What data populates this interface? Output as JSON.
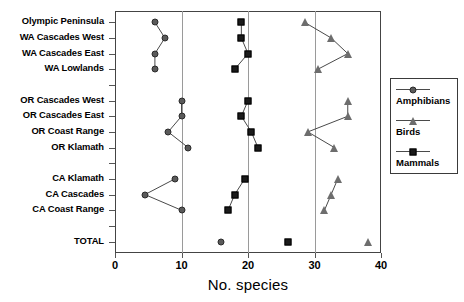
{
  "chart_data": {
    "type": "scatter",
    "title": "",
    "xlabel": "No. species",
    "ylabel": "",
    "xlim": [
      0,
      40
    ],
    "xticks": [
      0,
      10,
      20,
      30,
      40
    ],
    "xticklabels": [
      "0",
      "10",
      "20",
      "30",
      "40"
    ],
    "grid": "vertical gridlines at 10, 20, 30",
    "legend_position": "right-outside",
    "categories": [
      "Olympic Peninsula",
      "WA Cascades West",
      "WA Cascades East",
      "WA Lowlands",
      "",
      "OR Cascades West",
      "OR Cascades East",
      "OR Coast Range",
      "OR Klamath",
      "",
      "CA Klamath",
      "CA Cascades",
      "CA Coast Range",
      "",
      "TOTAL"
    ],
    "series": [
      {
        "name": "Amphibians",
        "marker": "circle",
        "color": "#5a5a5a",
        "values": [
          6,
          7.5,
          6,
          6,
          null,
          10,
          10,
          8,
          11,
          null,
          9,
          4.5,
          10,
          null,
          16
        ]
      },
      {
        "name": "Birds",
        "marker": "triangle",
        "color": "#6d6d6d",
        "values": [
          28.5,
          32.5,
          35,
          30.5,
          null,
          35,
          35,
          29,
          33,
          null,
          33.5,
          32.5,
          31.5,
          null,
          38
        ]
      },
      {
        "name": "Mammals",
        "marker": "square",
        "color": "#1b1b1b",
        "values": [
          19,
          19,
          20,
          18,
          null,
          20,
          19,
          20.5,
          21.5,
          null,
          19.5,
          18,
          17,
          null,
          26
        ]
      }
    ]
  },
  "axis": {
    "x_title": "No. species",
    "x_tick_labels": [
      "0",
      "10",
      "20",
      "30",
      "40"
    ],
    "y_tick_labels": [
      "Olympic Peninsula",
      "WA Cascades West",
      "WA Cascades East",
      "WA Lowlands",
      "",
      "OR Cascades West",
      "OR Cascades East",
      "OR Coast Range",
      "OR Klamath",
      "",
      "CA Klamath",
      "CA Cascades",
      "CA Coast Range",
      "",
      "TOTAL"
    ]
  },
  "legend": {
    "entries": [
      {
        "label": "Amphibians",
        "marker": "circle"
      },
      {
        "label": "Birds",
        "marker": "triangle"
      },
      {
        "label": "Mammals",
        "marker": "square"
      }
    ]
  },
  "colors": {
    "amphibians": "#5a5a5a",
    "birds": "#6d6d6d",
    "mammals": "#1b1b1b",
    "frame": "#444444",
    "gridline": "#9a9a9a",
    "background": "#ffffff"
  }
}
